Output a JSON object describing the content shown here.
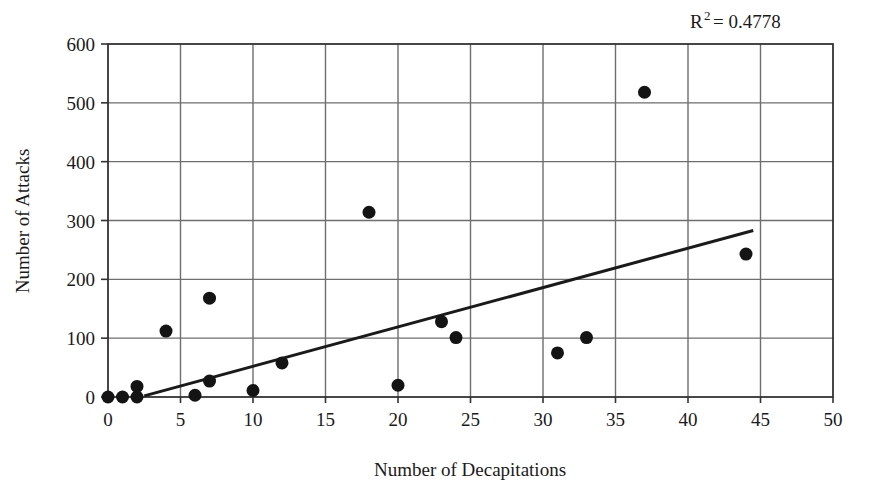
{
  "chart_data": {
    "type": "scatter",
    "title": "",
    "xlabel": "Number of Decapitations",
    "ylabel": "Number of Attacks",
    "xlim": [
      0,
      50
    ],
    "ylim": [
      0,
      600
    ],
    "xticks": [
      0,
      5,
      10,
      15,
      20,
      25,
      30,
      35,
      40,
      45,
      50
    ],
    "yticks": [
      0,
      100,
      200,
      300,
      400,
      500,
      600
    ],
    "grid": true,
    "legend": "none",
    "annotations": [
      {
        "name": "r-squared",
        "text": "R2 = 0.4778",
        "base": "R",
        "superscript": "2",
        "rest": " = 0.4778",
        "x": 37.5,
        "y": 640
      }
    ],
    "series": [
      {
        "name": "observations",
        "type": "scatter",
        "marker": "filled-circle",
        "marker_size": 13,
        "color": "#141414",
        "points": [
          {
            "x": 0,
            "y": 0
          },
          {
            "x": 1,
            "y": 0
          },
          {
            "x": 2,
            "y": 0
          },
          {
            "x": 2,
            "y": 18
          },
          {
            "x": 4,
            "y": 112
          },
          {
            "x": 6,
            "y": 3
          },
          {
            "x": 7,
            "y": 27
          },
          {
            "x": 7,
            "y": 168
          },
          {
            "x": 10,
            "y": 11
          },
          {
            "x": 12,
            "y": 58
          },
          {
            "x": 18,
            "y": 314
          },
          {
            "x": 20,
            "y": 20
          },
          {
            "x": 23,
            "y": 128
          },
          {
            "x": 24,
            "y": 101
          },
          {
            "x": 31,
            "y": 75
          },
          {
            "x": 33,
            "y": 101
          },
          {
            "x": 37,
            "y": 518
          },
          {
            "x": 44,
            "y": 243
          }
        ]
      },
      {
        "name": "trendline",
        "type": "line",
        "color": "#1a1a1a",
        "width": 3,
        "x_start": 2.5,
        "y_start": 2,
        "x_end": 44.5,
        "y_end": 283
      }
    ],
    "colors": {
      "marker": "#141414",
      "trendline": "#1a1a1a",
      "gridline": "#6e6e6e",
      "axis": "#333333",
      "background": "#ffffff",
      "text": "#1a1a1a"
    }
  },
  "axes": {
    "x_title": "Number of Decapitations",
    "y_title": "Number of Attacks",
    "x_tick_labels": [
      "0",
      "5",
      "10",
      "15",
      "20",
      "25",
      "30",
      "35",
      "40",
      "45",
      "50"
    ],
    "y_tick_labels": [
      "0",
      "100",
      "200",
      "300",
      "400",
      "500",
      "600"
    ]
  },
  "annotation": {
    "r2_base": "R",
    "r2_sup": "2",
    "r2_rest": "= 0.4778"
  }
}
